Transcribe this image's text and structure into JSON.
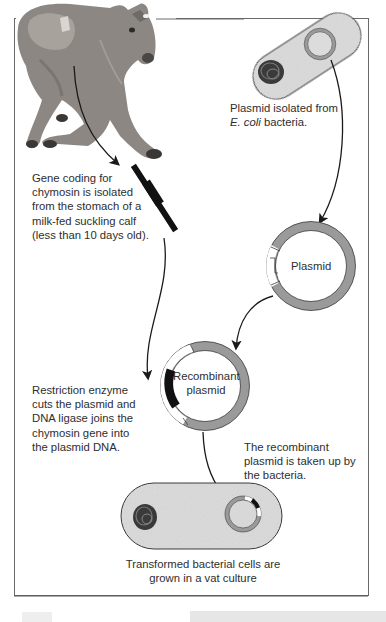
{
  "labels": {
    "ecoli_plasmid": {
      "line1_italic": "E. coli",
      "line0": "Plasmid isolated from",
      "line1_rest": " bacteria."
    },
    "gene": [
      "Gene coding for",
      "chymosin is isolated",
      "from the stomach of a",
      "milk-fed suckling calf",
      "(less than 10 days old)."
    ],
    "plasmid": "Plasmid",
    "recombinant": [
      "Recombinant",
      "plasmid"
    ],
    "restriction": [
      "Restriction enzyme",
      "cuts the plasmid and",
      "DNA ligase joins the",
      "chymosin gene into",
      "the plasmid DNA."
    ],
    "uptake": [
      "The recombinant",
      "plasmid is taken up by",
      "the bacteria."
    ],
    "culture": [
      "Transformed bacterial cells are",
      "grown in a vat culture"
    ]
  },
  "colors": {
    "cell_fill": "#dcdcdc",
    "plasmid_ring": "#9a9a9a",
    "outline": "#3a3a3a",
    "gene_black": "#111111",
    "frame": "#6a6a6a"
  }
}
